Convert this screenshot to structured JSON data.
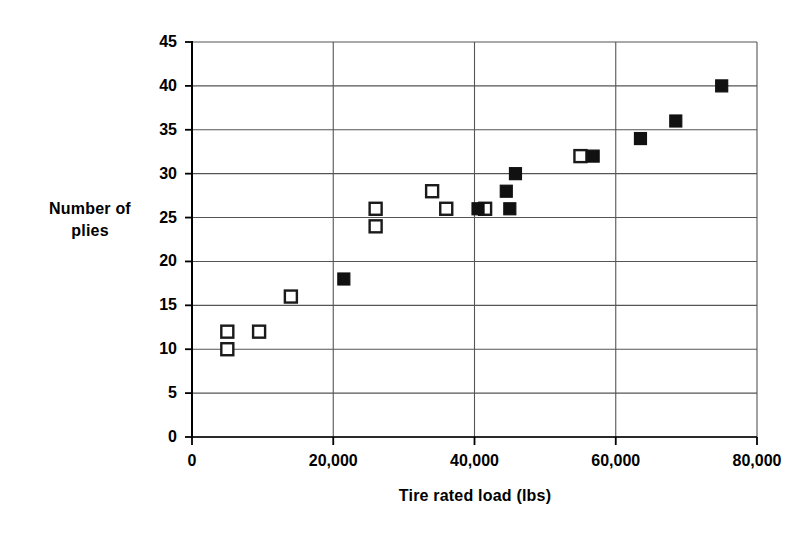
{
  "chart_data": {
    "type": "scatter",
    "title": "",
    "xlabel": "Tire rated load (lbs)",
    "ylabel_line1": "Number of",
    "ylabel_line2": "plies",
    "xlim": [
      0,
      80000
    ],
    "ylim": [
      0,
      45
    ],
    "xticks": [
      0,
      20000,
      40000,
      60000,
      80000
    ],
    "xtick_labels": [
      "0",
      "20,000",
      "40,000",
      "60,000",
      "80,000"
    ],
    "yticks": [
      0,
      5,
      10,
      15,
      20,
      25,
      30,
      35,
      40,
      45
    ],
    "ytick_labels": [
      "0",
      "5",
      "10",
      "15",
      "20",
      "25",
      "30",
      "35",
      "40",
      "45"
    ],
    "grid": {
      "horizontal": true,
      "vertical": true,
      "color": "#555555"
    },
    "legend": {
      "visible": false,
      "position": "none"
    },
    "marker_colors": {
      "open_fill": "#ffffff",
      "open_stroke": "#1a1a1a",
      "filled": "#111111"
    },
    "series": [
      {
        "name": "open-square-series",
        "marker": "open-square",
        "points": [
          {
            "x": 5000,
            "y": 12
          },
          {
            "x": 5000,
            "y": 10
          },
          {
            "x": 9500,
            "y": 12
          },
          {
            "x": 14000,
            "y": 16
          },
          {
            "x": 26000,
            "y": 26
          },
          {
            "x": 26000,
            "y": 24
          },
          {
            "x": 34000,
            "y": 28
          },
          {
            "x": 36000,
            "y": 26
          },
          {
            "x": 41500,
            "y": 26
          },
          {
            "x": 55000,
            "y": 32
          }
        ]
      },
      {
        "name": "filled-square-series",
        "marker": "filled-square",
        "points": [
          {
            "x": 21500,
            "y": 18
          },
          {
            "x": 40500,
            "y": 26
          },
          {
            "x": 44500,
            "y": 28
          },
          {
            "x": 45000,
            "y": 26
          },
          {
            "x": 45800,
            "y": 30
          },
          {
            "x": 56800,
            "y": 32
          },
          {
            "x": 63500,
            "y": 34
          },
          {
            "x": 68500,
            "y": 36
          },
          {
            "x": 75000,
            "y": 40
          }
        ]
      }
    ]
  }
}
